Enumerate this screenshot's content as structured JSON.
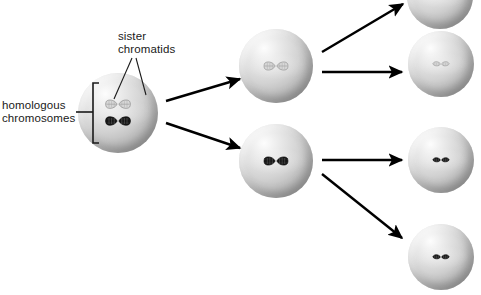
{
  "figure": {
    "background_color": "#ffffff",
    "width": 481,
    "height": 295
  },
  "labels": {
    "sister_chromatids": "sister\nchromatids",
    "homologous_chromosomes": "homologous\nchromosomes"
  },
  "colors": {
    "light_chromosome": "#d8d8d8",
    "dark_chromosome": "#1e1e1e",
    "cell_fill": "#c9c9c9",
    "arrow": "#000000",
    "text": "#1a1a1a"
  },
  "cells": [
    {
      "name": "parent-cell",
      "stage": "parent",
      "cx": 118,
      "cy": 113,
      "r": 40,
      "chromosomes": [
        {
          "tone": "light",
          "form": "duplicated-pair"
        },
        {
          "tone": "dark",
          "form": "duplicated-pair"
        }
      ]
    },
    {
      "name": "intermediate-cell-top",
      "stage": "intermediate",
      "cx": 276,
      "cy": 66,
      "r": 37,
      "chromosomes": [
        {
          "tone": "light",
          "form": "duplicated-pair"
        }
      ]
    },
    {
      "name": "intermediate-cell-bottom",
      "stage": "intermediate",
      "cx": 276,
      "cy": 161,
      "r": 37,
      "chromosomes": [
        {
          "tone": "dark",
          "form": "duplicated-pair"
        }
      ]
    },
    {
      "name": "daughter-cell-1",
      "stage": "daughter",
      "cx": 440,
      "cy": -4,
      "r": 33,
      "chromosomes": [
        {
          "tone": "light",
          "form": "single"
        }
      ]
    },
    {
      "name": "daughter-cell-2",
      "stage": "daughter",
      "cx": 441,
      "cy": 64,
      "r": 33,
      "chromosomes": [
        {
          "tone": "light",
          "form": "single"
        }
      ]
    },
    {
      "name": "daughter-cell-3",
      "stage": "daughter",
      "cx": 441,
      "cy": 160,
      "r": 33,
      "chromosomes": [
        {
          "tone": "dark",
          "form": "single"
        }
      ]
    },
    {
      "name": "daughter-cell-4",
      "stage": "daughter",
      "cx": 441,
      "cy": 257,
      "r": 33,
      "chromosomes": [
        {
          "tone": "dark",
          "form": "single"
        }
      ]
    }
  ],
  "arrows": [
    {
      "name": "arrow-parent-to-top",
      "x1": 166,
      "y1": 101,
      "x2": 240,
      "y2": 79
    },
    {
      "name": "arrow-parent-to-bottom",
      "x1": 166,
      "y1": 123,
      "x2": 240,
      "y2": 148
    },
    {
      "name": "arrow-top-to-daughter1",
      "x1": 322,
      "y1": 52,
      "x2": 403,
      "y2": 4
    },
    {
      "name": "arrow-top-to-daughter2",
      "x1": 322,
      "y1": 72,
      "x2": 402,
      "y2": 72
    },
    {
      "name": "arrow-bottom-to-daughter3",
      "x1": 322,
      "y1": 160,
      "x2": 402,
      "y2": 160
    },
    {
      "name": "arrow-bottom-to-daughter4",
      "x1": 322,
      "y1": 174,
      "x2": 402,
      "y2": 238
    }
  ],
  "leaders": {
    "sister_chromatids_lines": [
      {
        "x1": 132,
        "y1": 58,
        "x2": 114,
        "y2": 99
      },
      {
        "x1": 136,
        "y1": 58,
        "x2": 146,
        "y2": 95
      }
    ],
    "homologous_bracket": {
      "x": 93,
      "top": 83,
      "bottom": 143,
      "tick": 6,
      "stem_x1": 76,
      "stem_x2": 93,
      "stem_y": 112
    }
  }
}
